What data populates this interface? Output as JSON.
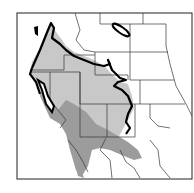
{
  "map": {
    "subject": "Species range map — western North America",
    "colors": {
      "background": "#ffffff",
      "range_light": "#c8c8c8",
      "range_dark": "#a0a0a0",
      "border": "#222222",
      "range_outline": "#000000"
    },
    "layers": [
      {
        "name": "state-borders",
        "label": "State borders"
      },
      {
        "name": "range-outer",
        "label": "Outer range (light gray)"
      },
      {
        "name": "range-core",
        "label": "Southern range (dark gray)"
      },
      {
        "name": "range-outline",
        "label": "Range boundary (thick line)"
      }
    ]
  }
}
